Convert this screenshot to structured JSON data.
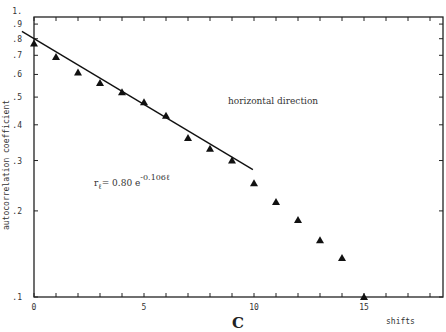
{
  "chart_data": {
    "type": "scatter",
    "title": "",
    "panel_label": "C",
    "xlabel": "shifts",
    "ylabel": "autocorrelation coefficient",
    "yscale": "log",
    "xlim": [
      0,
      18.6
    ],
    "ylim": [
      0.1,
      1.0
    ],
    "grid": false,
    "x_ticks": [
      0,
      5,
      10,
      15
    ],
    "x_minor_ticks": [
      1,
      2,
      3,
      4,
      6,
      7,
      8,
      9,
      11,
      12,
      13,
      14,
      16,
      17,
      18
    ],
    "y_ticks": [
      {
        "value": 1.0,
        "label": "1."
      },
      {
        "value": 0.9,
        "label": ".9"
      },
      {
        "value": 0.8,
        "label": ".8"
      },
      {
        "value": 0.7,
        "label": ".7"
      },
      {
        "value": 0.6,
        "label": ".6"
      },
      {
        "value": 0.5,
        "label": ".5"
      },
      {
        "value": 0.4,
        "label": ".4"
      },
      {
        "value": 0.3,
        "label": ".3"
      },
      {
        "value": 0.2,
        "label": ".2"
      },
      {
        "value": 0.1,
        "label": ".1"
      }
    ],
    "series": [
      {
        "name": "horizontal direction",
        "marker": "triangle",
        "x": [
          0,
          1,
          2,
          3,
          4,
          5,
          6,
          7,
          8,
          9,
          10,
          11,
          12,
          13,
          14,
          15
        ],
        "values": [
          0.77,
          0.69,
          0.61,
          0.56,
          0.52,
          0.48,
          0.43,
          0.36,
          0.33,
          0.3,
          0.25,
          0.215,
          0.186,
          0.158,
          0.137,
          0.1
        ]
      }
    ],
    "fit_line": {
      "equation": "r_ℓ = 0.80 e^(-0.106ℓ)",
      "a": 0.8,
      "b": -0.106,
      "x_range": [
        -0.55,
        9.95
      ]
    },
    "annotations": [
      {
        "text": "horizontal direction",
        "x": 9.3,
        "y": 0.52
      },
      {
        "text_main": "r",
        "text_sub": "ℓ",
        "text_eq": "= 0.80 e",
        "text_sup": "-0.106ℓ",
        "x": 3.9,
        "y": 0.24
      }
    ]
  }
}
